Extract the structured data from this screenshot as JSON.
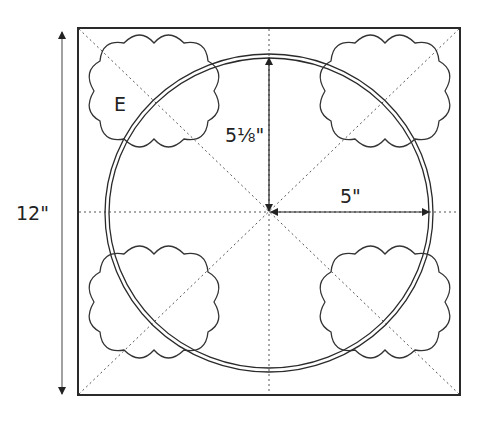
{
  "diagram": {
    "dimension_height": "12\"",
    "dimension_radius_vertical": "5⅛\"",
    "dimension_radius_horizontal": "5\"",
    "template_label": "E",
    "colors": {
      "line": "#2a2a2a",
      "guide": "#555555",
      "background": "#ffffff"
    }
  }
}
